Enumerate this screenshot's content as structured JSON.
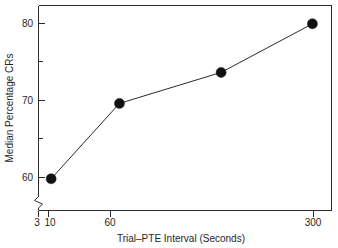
{
  "chart_data": {
    "type": "line",
    "title": "",
    "subtitle": "",
    "xlabel": "Trial–PTE  Interval (Seconds)",
    "ylabel": "Median Percentage CRs",
    "x": [
      3,
      10,
      60,
      300
    ],
    "values": [
      58,
      68.7,
      73.1,
      80
    ],
    "series": [
      {
        "name": "Median Percentage CRs",
        "x": [
          3,
          10,
          60,
          300
        ],
        "values": [
          58,
          68.7,
          73.1,
          80
        ]
      }
    ],
    "xtick_labels": [
      "3",
      "10",
      "60",
      "300"
    ],
    "xtick_values": [
      3,
      10,
      60,
      300
    ],
    "xscale": "log",
    "xlim": [
      2.4,
      420
    ],
    "ytick_labels": [
      "60",
      "70",
      "80"
    ],
    "ytick_values": [
      60,
      70,
      80
    ],
    "yminor_tick_values": [
      55,
      65,
      75
    ],
    "ylim": [
      53.5,
      82.6
    ],
    "grid": false,
    "legend": false,
    "legend_position": "none",
    "axis_break": "y-axis lower break",
    "marker": "filled-circle",
    "line_color": "#2b2b2b",
    "marker_color": "#111111",
    "background_color": "#ffffff"
  },
  "figure": {
    "x_axis_title": "Trial–PTE  Interval (Seconds)",
    "y_axis_title": "Median Percentage CRs"
  }
}
